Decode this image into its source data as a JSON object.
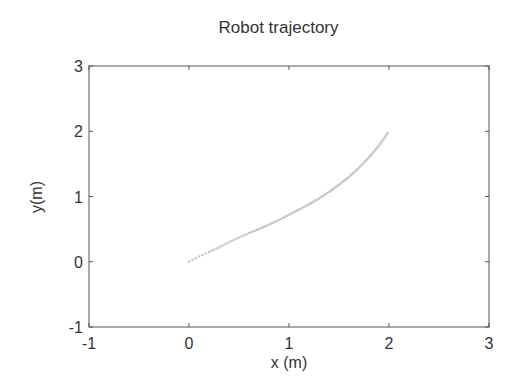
{
  "chart_data": {
    "type": "scatter",
    "title": "Robot trajectory",
    "xlabel": "x (m)",
    "ylabel": "y(m)",
    "xlim": [
      -1,
      3
    ],
    "ylim": [
      -1,
      3
    ],
    "xticks": [
      "-1",
      "0",
      "1",
      "2",
      "3"
    ],
    "yticks": [
      "-1",
      "0",
      "1",
      "2",
      "3"
    ],
    "grid": false,
    "series": [
      {
        "name": "trajectory",
        "color": "#c8c8c8",
        "x": [
          0.0,
          0.1,
          0.2,
          0.3,
          0.4,
          0.5,
          0.6,
          0.7,
          0.8,
          0.9,
          1.0,
          1.1,
          1.2,
          1.3,
          1.4,
          1.5,
          1.6,
          1.7,
          1.8,
          1.9,
          2.0
        ],
        "y": [
          0.0,
          0.08,
          0.15,
          0.22,
          0.3,
          0.37,
          0.44,
          0.5,
          0.57,
          0.64,
          0.72,
          0.8,
          0.88,
          0.97,
          1.07,
          1.18,
          1.3,
          1.44,
          1.6,
          1.78,
          2.0
        ]
      }
    ]
  }
}
